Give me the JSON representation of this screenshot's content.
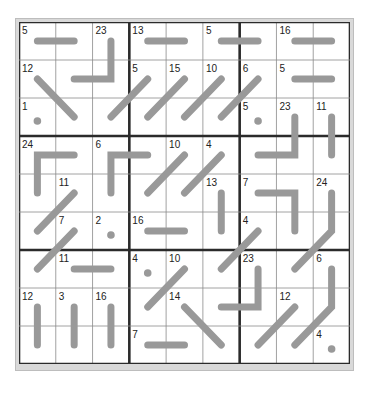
{
  "puzzle": {
    "type": "kakuro-path-grid",
    "rows": 9,
    "cols": 9,
    "colors": {
      "thin_line": "#8a8a8a",
      "thick_line": "#2b2b2b",
      "path": "#999999",
      "frame": "#cfcfcf",
      "background": "#ffffff",
      "text": "#222222"
    },
    "clues": [
      {
        "r": 0,
        "c": 0,
        "v": "5"
      },
      {
        "r": 0,
        "c": 2,
        "v": "23"
      },
      {
        "r": 0,
        "c": 3,
        "v": "13"
      },
      {
        "r": 0,
        "c": 5,
        "v": "5"
      },
      {
        "r": 0,
        "c": 7,
        "v": "16"
      },
      {
        "r": 1,
        "c": 0,
        "v": "12"
      },
      {
        "r": 1,
        "c": 3,
        "v": "5"
      },
      {
        "r": 1,
        "c": 4,
        "v": "15"
      },
      {
        "r": 1,
        "c": 5,
        "v": "10"
      },
      {
        "r": 1,
        "c": 6,
        "v": "6"
      },
      {
        "r": 1,
        "c": 7,
        "v": "5"
      },
      {
        "r": 2,
        "c": 0,
        "v": "1"
      },
      {
        "r": 2,
        "c": 6,
        "v": "5"
      },
      {
        "r": 2,
        "c": 7,
        "v": "23"
      },
      {
        "r": 2,
        "c": 8,
        "v": "11"
      },
      {
        "r": 3,
        "c": 0,
        "v": "24"
      },
      {
        "r": 3,
        "c": 2,
        "v": "6"
      },
      {
        "r": 3,
        "c": 4,
        "v": "10"
      },
      {
        "r": 3,
        "c": 5,
        "v": "4"
      },
      {
        "r": 4,
        "c": 1,
        "v": "11"
      },
      {
        "r": 4,
        "c": 5,
        "v": "13"
      },
      {
        "r": 4,
        "c": 6,
        "v": "7"
      },
      {
        "r": 4,
        "c": 8,
        "v": "24"
      },
      {
        "r": 5,
        "c": 1,
        "v": "7"
      },
      {
        "r": 5,
        "c": 2,
        "v": "2"
      },
      {
        "r": 5,
        "c": 3,
        "v": "16"
      },
      {
        "r": 5,
        "c": 6,
        "v": "4"
      },
      {
        "r": 6,
        "c": 1,
        "v": "11"
      },
      {
        "r": 6,
        "c": 3,
        "v": "4"
      },
      {
        "r": 6,
        "c": 4,
        "v": "10"
      },
      {
        "r": 6,
        "c": 6,
        "v": "23"
      },
      {
        "r": 6,
        "c": 8,
        "v": "6"
      },
      {
        "r": 7,
        "c": 0,
        "v": "12"
      },
      {
        "r": 7,
        "c": 1,
        "v": "3"
      },
      {
        "r": 7,
        "c": 2,
        "v": "16"
      },
      {
        "r": 7,
        "c": 4,
        "v": "14"
      },
      {
        "r": 7,
        "c": 7,
        "v": "12"
      },
      {
        "r": 8,
        "c": 3,
        "v": "7"
      },
      {
        "r": 8,
        "c": 8,
        "v": "4"
      }
    ],
    "paths": [
      [
        [
          0,
          0
        ],
        [
          0,
          1
        ]
      ],
      [
        [
          0,
          2
        ],
        [
          1,
          2
        ],
        [
          1,
          1
        ]
      ],
      [
        [
          1,
          0
        ],
        [
          2,
          1
        ]
      ],
      [
        [
          0,
          3
        ],
        [
          0,
          4
        ]
      ],
      [
        [
          0,
          5
        ],
        [
          0,
          6
        ]
      ],
      [
        [
          0,
          7
        ],
        [
          0,
          8
        ]
      ],
      [
        [
          1,
          3
        ],
        [
          2,
          2
        ]
      ],
      [
        [
          1,
          4
        ],
        [
          2,
          3
        ]
      ],
      [
        [
          1,
          5
        ],
        [
          2,
          4
        ]
      ],
      [
        [
          1,
          6
        ],
        [
          2,
          5
        ]
      ],
      [
        [
          1,
          7
        ],
        [
          1,
          8
        ]
      ],
      [
        [
          2,
          7
        ],
        [
          3,
          7
        ],
        [
          3,
          6
        ]
      ],
      [
        [
          2,
          8
        ],
        [
          3,
          8
        ]
      ],
      [
        [
          3,
          1
        ],
        [
          3,
          0
        ],
        [
          4,
          0
        ]
      ],
      [
        [
          3,
          3
        ],
        [
          3,
          2
        ],
        [
          4,
          2
        ]
      ],
      [
        [
          3,
          4
        ],
        [
          4,
          3
        ]
      ],
      [
        [
          3,
          5
        ],
        [
          4,
          4
        ]
      ],
      [
        [
          4,
          1
        ],
        [
          5,
          0
        ]
      ],
      [
        [
          4,
          5
        ],
        [
          5,
          5
        ]
      ],
      [
        [
          4,
          6
        ],
        [
          4,
          7
        ],
        [
          5,
          7
        ]
      ],
      [
        [
          4,
          8
        ],
        [
          5,
          8
        ],
        [
          6,
          7
        ]
      ],
      [
        [
          5,
          1
        ],
        [
          6,
          0
        ]
      ],
      [
        [
          5,
          3
        ],
        [
          5,
          4
        ]
      ],
      [
        [
          5,
          6
        ],
        [
          6,
          5
        ]
      ],
      [
        [
          6,
          1
        ],
        [
          6,
          2
        ]
      ],
      [
        [
          6,
          4
        ],
        [
          7,
          3
        ]
      ],
      [
        [
          6,
          6
        ],
        [
          7,
          6
        ],
        [
          7,
          5
        ]
      ],
      [
        [
          6,
          8
        ],
        [
          7,
          8
        ],
        [
          8,
          7
        ]
      ],
      [
        [
          7,
          0
        ],
        [
          8,
          0
        ]
      ],
      [
        [
          7,
          1
        ],
        [
          8,
          1
        ]
      ],
      [
        [
          7,
          2
        ],
        [
          8,
          2
        ]
      ],
      [
        [
          7,
          4
        ],
        [
          8,
          5
        ]
      ],
      [
        [
          7,
          7
        ],
        [
          8,
          6
        ]
      ],
      [
        [
          8,
          3
        ],
        [
          8,
          4
        ]
      ]
    ],
    "dots": [
      [
        2,
        0
      ],
      [
        2,
        6
      ],
      [
        5,
        2
      ],
      [
        6,
        3
      ],
      [
        8,
        8
      ]
    ]
  }
}
